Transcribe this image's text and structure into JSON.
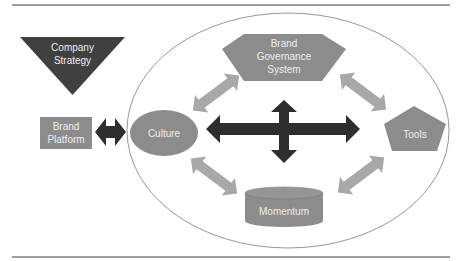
{
  "colors": {
    "background": "#ffffff",
    "rule_line": "#3a3a3a",
    "ellipse_stroke": "#8a8a8a",
    "dark_shape": "#404040",
    "mid_shape": "#8c8c8c",
    "light_arrow": "#a8a8a8",
    "dark_arrow": "#2e2e2e",
    "label_text": "#eeeeee"
  },
  "nodes": {
    "company_strategy": {
      "shape": "inverted-triangle",
      "line1": "Company",
      "line2": "Strategy"
    },
    "brand_platform": {
      "shape": "rectangle",
      "line1": "Brand",
      "line2": "Platform"
    },
    "culture": {
      "shape": "ellipse",
      "label": "Culture"
    },
    "brand_governance_system": {
      "shape": "hexagon",
      "line1": "Brand",
      "line2": "Governance",
      "line3": "System"
    },
    "tools": {
      "shape": "pentagon",
      "label": "Tools"
    },
    "momentum": {
      "shape": "cylinder",
      "label": "Momentum"
    }
  },
  "connections": [
    {
      "from": "Brand Platform",
      "to": "Culture",
      "type": "double-arrow",
      "style": "dark"
    },
    {
      "from": "Culture",
      "to": "Brand Governance System",
      "type": "double-arrow",
      "style": "light"
    },
    {
      "from": "Brand Governance System",
      "to": "Tools",
      "type": "double-arrow",
      "style": "light"
    },
    {
      "from": "Culture",
      "to": "Momentum",
      "type": "double-arrow",
      "style": "light"
    },
    {
      "from": "Tools",
      "to": "Momentum",
      "type": "double-arrow",
      "style": "light"
    },
    {
      "from": "center",
      "to": "all-directions",
      "type": "four-way-arrow",
      "style": "dark"
    }
  ]
}
